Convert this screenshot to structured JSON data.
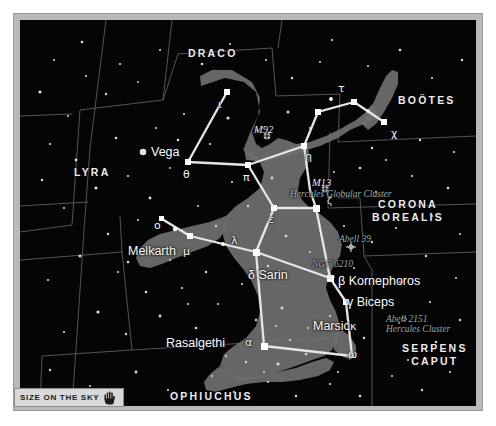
{
  "chart": {
    "title_constellation": "Hercules",
    "background_color": "#050506",
    "frame_color": "#b9b9b9",
    "constellation_figure_color": "#7c7c7c",
    "stickfigure_color": "#e8e8e8",
    "boundary_color": "#6a6a6a"
  },
  "constellations": [
    {
      "name": "DRACO",
      "x": 168,
      "y": 33,
      "lines": [
        "DRACO"
      ]
    },
    {
      "name": "BOOTES",
      "x": 382,
      "y": 80,
      "lines": [
        "BOÖTES"
      ]
    },
    {
      "name": "LYRA",
      "x": 74,
      "y": 152,
      "lines": [
        "LYRA"
      ]
    },
    {
      "name": "CORONA BOREALIS",
      "x": 365,
      "y": 186,
      "lines": [
        "CORONA",
        "BOREALIS"
      ]
    },
    {
      "name": "SERPENS CAPUT",
      "x": 387,
      "y": 331,
      "lines": [
        "SERPENS",
        "CAPUT"
      ]
    },
    {
      "name": "OPHIUCHUS",
      "x": 163,
      "y": 379,
      "lines": [
        "OPHIUCHUS"
      ]
    }
  ],
  "stars": [
    {
      "label": "Vega",
      "x": 131,
      "y": 132,
      "type": "named"
    },
    {
      "label": "Melkarth",
      "x": 128,
      "y": 231,
      "type": "named"
    },
    {
      "label": "Rasalgethi",
      "x": 176,
      "y": 323,
      "type": "named"
    },
    {
      "label": "Marsic",
      "x": 299,
      "y": 307,
      "type": "named"
    },
    {
      "label": "β Kornephoros",
      "x": 334,
      "y": 263,
      "type": "named"
    },
    {
      "label": "γ Biceps",
      "x": 340,
      "y": 283,
      "type": "named"
    },
    {
      "label": "δ Sarin",
      "x": 256,
      "y": 255,
      "type": "named"
    }
  ],
  "greek_labels": [
    {
      "label": "ι",
      "x": 222,
      "y": 85
    },
    {
      "label": "τ",
      "x": 328,
      "y": 79
    },
    {
      "label": "χ",
      "x": 374,
      "y": 117
    },
    {
      "label": "η",
      "x": 292,
      "y": 140
    },
    {
      "label": "θ",
      "x": 183,
      "y": 165
    },
    {
      "label": "π",
      "x": 245,
      "y": 170
    },
    {
      "label": "ζ",
      "x": 315,
      "y": 194
    },
    {
      "label": "ε",
      "x": 270,
      "y": 208
    },
    {
      "label": "ο",
      "x": 154,
      "y": 216
    },
    {
      "label": "μ",
      "x": 186,
      "y": 232
    },
    {
      "label": "λ",
      "x": 232,
      "y": 235
    },
    {
      "label": "α",
      "x": 247,
      "y": 324
    },
    {
      "label": "κ",
      "x": 345,
      "y": 308
    },
    {
      "label": "ω",
      "x": 347,
      "y": 336
    }
  ],
  "deep_sky_objects": [
    {
      "label": "M92",
      "x": 258,
      "y": 111,
      "sub": null,
      "marker_x": 247,
      "marker_y": 116
    },
    {
      "label": "M13",
      "x": 315,
      "y": 165,
      "sub": "Hercules Globular Cluster",
      "marker_x": 305,
      "marker_y": 169
    },
    {
      "label": "Abell 39",
      "x": 337,
      "y": 222,
      "sub": null,
      "marker_x": 330,
      "marker_y": 226
    },
    {
      "label": "NGC 6210",
      "x": 315,
      "y": 248,
      "sub": null,
      "marker_x": 309,
      "marker_y": 256
    },
    {
      "label": "Abell 2151",
      "x": 389,
      "y": 303,
      "sub": "Hercules Cluster",
      "marker_x": 383,
      "marker_y": 300
    }
  ],
  "banner": {
    "text": "SIZE ON THE SKY",
    "icon": "open-hand-icon"
  }
}
